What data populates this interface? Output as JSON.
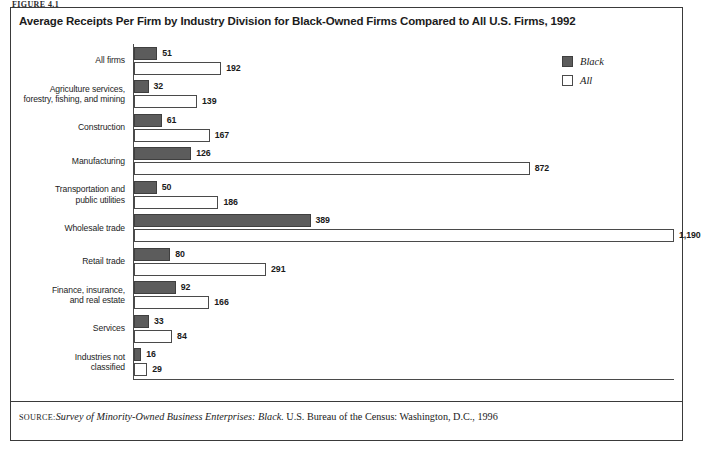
{
  "figure": {
    "figure_label": "FIGURE 4.1",
    "title": "Average Receipts Per Firm by Industry Division for Black-Owned Firms Compared to All U.S. Firms, 1992"
  },
  "legend": {
    "items": [
      {
        "label": "Black",
        "color": "#5c5c5c",
        "swatch": "filled"
      },
      {
        "label": "All",
        "color": "#ffffff",
        "swatch": "outline"
      }
    ]
  },
  "source": {
    "keyword": "SOURCE:",
    "italic_part": "Survey of Minority-Owned Business Enterprises: Black.",
    "rest": " U.S. Bureau of the Census:  Washington, D.C., 1996"
  },
  "chart_data": {
    "type": "bar",
    "orientation": "horizontal",
    "title": "Average Receipts Per Firm by Industry Division for Black-Owned Firms Compared to All U.S. Firms, 1992",
    "xlabel": "",
    "ylabel": "",
    "grid": false,
    "legend_position": "right-top",
    "value_unit": "thousands of dollars",
    "xlim": [
      0,
      1190
    ],
    "categories": [
      "All firms",
      "Agriculture services, forestry, fishing, and mining",
      "Construction",
      "Manufacturing",
      "Transportation and public utilities",
      "Wholesale trade",
      "Retail trade",
      "Finance, insurance, and real estate",
      "Services",
      "Industries not classified"
    ],
    "category_lines": [
      [
        "All firms"
      ],
      [
        "Agriculture services,",
        "forestry, fishing, and mining"
      ],
      [
        "Construction"
      ],
      [
        "Manufacturing"
      ],
      [
        "Transportation and",
        "public utilities"
      ],
      [
        "Wholesale trade"
      ],
      [
        "Retail trade"
      ],
      [
        "Finance, insurance,",
        "and real estate"
      ],
      [
        "Services"
      ],
      [
        "Industries not",
        "classified"
      ]
    ],
    "series": [
      {
        "name": "Black",
        "values": [
          51,
          32,
          61,
          126,
          50,
          389,
          80,
          92,
          33,
          16
        ],
        "labels": [
          "51",
          "32",
          "61",
          "126",
          "50",
          "389",
          "80",
          "92",
          "33",
          "16"
        ]
      },
      {
        "name": "All",
        "values": [
          192,
          139,
          167,
          872,
          186,
          1190,
          291,
          166,
          84,
          29
        ],
        "labels": [
          "192",
          "139",
          "167",
          "872",
          "186",
          "1,190",
          "291",
          "166",
          "84",
          "29"
        ]
      }
    ]
  }
}
